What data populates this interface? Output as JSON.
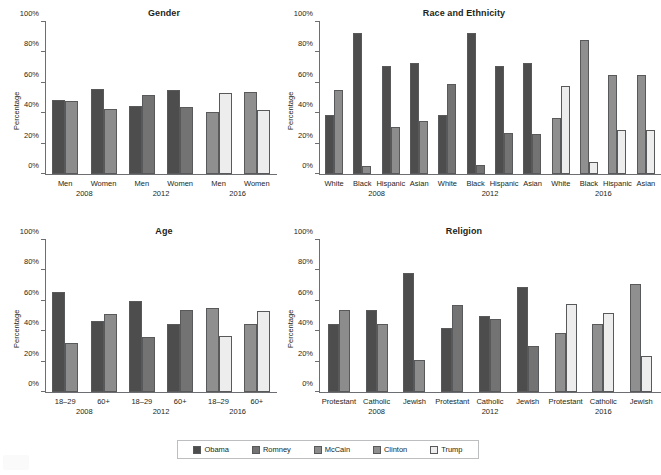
{
  "colors": {
    "obama": "#4d4d4d",
    "romney": "#737373",
    "mccain": "#8c8c8c",
    "clinton": "#8f8f8f",
    "trump": "#ededed",
    "axis": "#6d6e71",
    "text": "#231f20",
    "legend_border": "#bcbec0"
  },
  "yaxis": {
    "label": "Percentage",
    "ticks": [
      "0%",
      "20%",
      "40%",
      "60%",
      "80%",
      "100%"
    ],
    "min": 0,
    "max": 100
  },
  "legend": {
    "items": [
      {
        "label": "Obama",
        "color": "#4d4d4d"
      },
      {
        "label": "Romney",
        "color": "#737373"
      },
      {
        "label": "McCain",
        "color": "#8c8c8c"
      },
      {
        "label": "Clinton",
        "color": "#8f8f8f"
      },
      {
        "label": "Trump",
        "color": "#ededed"
      }
    ]
  },
  "chart_data": [
    {
      "type": "bar",
      "title": "Gender",
      "xlabel": "",
      "ylabel": "Percentage",
      "ylim": [
        0,
        100
      ],
      "grid": false,
      "legend_position": "bottom",
      "years": [
        "2008",
        "2012",
        "2016"
      ],
      "categories": [
        "Men",
        "Women"
      ],
      "groups": [
        {
          "year": "2008",
          "categories": [
            {
              "name": "Men",
              "bars": [
                {
                  "series": "Obama",
                  "value": 49
                },
                {
                  "series": "McCain",
                  "value": 48
                }
              ]
            },
            {
              "name": "Women",
              "bars": [
                {
                  "series": "Obama",
                  "value": 56
                },
                {
                  "series": "McCain",
                  "value": 43
                }
              ]
            }
          ]
        },
        {
          "year": "2012",
          "categories": [
            {
              "name": "Men",
              "bars": [
                {
                  "series": "Obama",
                  "value": 45
                },
                {
                  "series": "Romney",
                  "value": 52
                }
              ]
            },
            {
              "name": "Women",
              "bars": [
                {
                  "series": "Obama",
                  "value": 55
                },
                {
                  "series": "Romney",
                  "value": 44
                }
              ]
            }
          ]
        },
        {
          "year": "2016",
          "categories": [
            {
              "name": "Men",
              "bars": [
                {
                  "series": "Clinton",
                  "value": 41
                },
                {
                  "series": "Trump",
                  "value": 53
                }
              ]
            },
            {
              "name": "Women",
              "bars": [
                {
                  "series": "Clinton",
                  "value": 54
                },
                {
                  "series": "Trump",
                  "value": 42
                }
              ]
            }
          ]
        }
      ]
    },
    {
      "type": "bar",
      "title": "Race and Ethnicity",
      "xlabel": "",
      "ylabel": "Percentage",
      "ylim": [
        0,
        100
      ],
      "grid": false,
      "legend_position": "bottom",
      "years": [
        "2008",
        "2012",
        "2016"
      ],
      "categories": [
        "White",
        "Black",
        "Hispanic",
        "Asian"
      ],
      "groups": [
        {
          "year": "2008",
          "categories": [
            {
              "name": "White",
              "bars": [
                {
                  "series": "Obama",
                  "value": 39
                },
                {
                  "series": "McCain",
                  "value": 55
                }
              ]
            },
            {
              "name": "Black",
              "bars": [
                {
                  "series": "Obama",
                  "value": 93
                },
                {
                  "series": "McCain",
                  "value": 5
                }
              ]
            },
            {
              "name": "Hispanic",
              "bars": [
                {
                  "series": "Obama",
                  "value": 71
                },
                {
                  "series": "McCain",
                  "value": 31
                }
              ]
            },
            {
              "name": "Asian",
              "bars": [
                {
                  "series": "Obama",
                  "value": 73
                },
                {
                  "series": "McCain",
                  "value": 35
                }
              ]
            }
          ]
        },
        {
          "year": "2012",
          "categories": [
            {
              "name": "White",
              "bars": [
                {
                  "series": "Obama",
                  "value": 39
                },
                {
                  "series": "Romney",
                  "value": 59
                }
              ]
            },
            {
              "name": "Black",
              "bars": [
                {
                  "series": "Obama",
                  "value": 93
                },
                {
                  "series": "Romney",
                  "value": 6
                }
              ]
            },
            {
              "name": "Hispanic",
              "bars": [
                {
                  "series": "Obama",
                  "value": 71
                },
                {
                  "series": "Romney",
                  "value": 27
                }
              ]
            },
            {
              "name": "Asian",
              "bars": [
                {
                  "series": "Obama",
                  "value": 73
                },
                {
                  "series": "Romney",
                  "value": 26
                }
              ]
            }
          ]
        },
        {
          "year": "2016",
          "categories": [
            {
              "name": "White",
              "bars": [
                {
                  "series": "Clinton",
                  "value": 37
                },
                {
                  "series": "Trump",
                  "value": 58
                }
              ]
            },
            {
              "name": "Black",
              "bars": [
                {
                  "series": "Clinton",
                  "value": 88
                },
                {
                  "series": "Trump",
                  "value": 8
                }
              ]
            },
            {
              "name": "Hispanic",
              "bars": [
                {
                  "series": "Clinton",
                  "value": 65
                },
                {
                  "series": "Trump",
                  "value": 29
                }
              ]
            },
            {
              "name": "Asian",
              "bars": [
                {
                  "series": "Clinton",
                  "value": 65
                },
                {
                  "series": "Trump",
                  "value": 29
                }
              ]
            }
          ]
        }
      ]
    },
    {
      "type": "bar",
      "title": "Age",
      "xlabel": "",
      "ylabel": "Percentage",
      "ylim": [
        0,
        100
      ],
      "grid": false,
      "legend_position": "bottom",
      "years": [
        "2008",
        "2012",
        "2016"
      ],
      "categories": [
        "18–29",
        "60+"
      ],
      "groups": [
        {
          "year": "2008",
          "categories": [
            {
              "name": "18–29",
              "bars": [
                {
                  "series": "Obama",
                  "value": 66
                },
                {
                  "series": "McCain",
                  "value": 32
                }
              ]
            },
            {
              "name": "60+",
              "bars": [
                {
                  "series": "Obama",
                  "value": 47
                },
                {
                  "series": "McCain",
                  "value": 51
                }
              ]
            }
          ]
        },
        {
          "year": "2012",
          "categories": [
            {
              "name": "18–29",
              "bars": [
                {
                  "series": "Obama",
                  "value": 60
                },
                {
                  "series": "Romney",
                  "value": 36
                }
              ]
            },
            {
              "name": "60+",
              "bars": [
                {
                  "series": "Obama",
                  "value": 45
                },
                {
                  "series": "Romney",
                  "value": 54
                }
              ]
            }
          ]
        },
        {
          "year": "2016",
          "categories": [
            {
              "name": "18–29",
              "bars": [
                {
                  "series": "Clinton",
                  "value": 55
                },
                {
                  "series": "Trump",
                  "value": 37
                }
              ]
            },
            {
              "name": "60+",
              "bars": [
                {
                  "series": "Clinton",
                  "value": 45
                },
                {
                  "series": "Trump",
                  "value": 53
                }
              ]
            }
          ]
        }
      ]
    },
    {
      "type": "bar",
      "title": "Religion",
      "xlabel": "",
      "ylabel": "Percentage",
      "ylim": [
        0,
        100
      ],
      "grid": false,
      "legend_position": "bottom",
      "years": [
        "2008",
        "2012",
        "2016"
      ],
      "categories": [
        "Protestant",
        "Catholic",
        "Jewish"
      ],
      "groups": [
        {
          "year": "2008",
          "categories": [
            {
              "name": "Protestant",
              "bars": [
                {
                  "series": "Obama",
                  "value": 45
                },
                {
                  "series": "McCain",
                  "value": 54
                }
              ]
            },
            {
              "name": "Catholic",
              "bars": [
                {
                  "series": "Obama",
                  "value": 54
                },
                {
                  "series": "McCain",
                  "value": 45
                }
              ]
            },
            {
              "name": "Jewish",
              "bars": [
                {
                  "series": "Obama",
                  "value": 78
                },
                {
                  "series": "McCain",
                  "value": 21
                }
              ]
            }
          ]
        },
        {
          "year": "2012",
          "categories": [
            {
              "name": "Protestant",
              "bars": [
                {
                  "series": "Obama",
                  "value": 42
                },
                {
                  "series": "Romney",
                  "value": 57
                }
              ]
            },
            {
              "name": "Catholic",
              "bars": [
                {
                  "series": "Obama",
                  "value": 50
                },
                {
                  "series": "Romney",
                  "value": 48
                }
              ]
            },
            {
              "name": "Jewish",
              "bars": [
                {
                  "series": "Obama",
                  "value": 69
                },
                {
                  "series": "Romney",
                  "value": 30
                }
              ]
            }
          ]
        },
        {
          "year": "2016",
          "categories": [
            {
              "name": "Protestant",
              "bars": [
                {
                  "series": "Clinton",
                  "value": 39
                },
                {
                  "series": "Trump",
                  "value": 58
                }
              ]
            },
            {
              "name": "Catholic",
              "bars": [
                {
                  "series": "Clinton",
                  "value": 45
                },
                {
                  "series": "Trump",
                  "value": 52
                }
              ]
            },
            {
              "name": "Jewish",
              "bars": [
                {
                  "series": "Clinton",
                  "value": 71
                },
                {
                  "series": "Trump",
                  "value": 24
                }
              ]
            }
          ]
        }
      ]
    }
  ]
}
